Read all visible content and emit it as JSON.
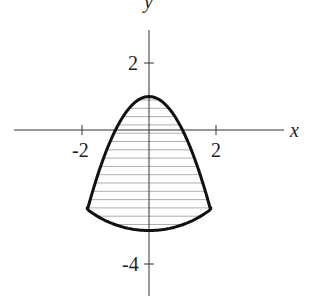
{
  "chart_data": {
    "type": "area",
    "title": "",
    "xlabel": "x",
    "ylabel": "y",
    "x_ticks": [
      -2,
      2
    ],
    "y_ticks": [
      2,
      -4
    ],
    "x_tick_labels": [
      "-2",
      "2"
    ],
    "y_tick_labels": [
      "2",
      "-4"
    ],
    "xlim": [
      -4,
      4
    ],
    "ylim": [
      -5,
      3.5
    ],
    "grid": false,
    "curves": [
      {
        "name": "upper boundary",
        "equation": "y = 1 - x^2"
      },
      {
        "name": "lower boundary",
        "equation": "x^2 + y^2 = 9 (lower arc)"
      }
    ],
    "region": {
      "description": "Shaded region between parabola y = 1 - x^2 and circle x^2 + y^2 = 9",
      "intersections": [
        [
          -1.84,
          -2.37
        ],
        [
          1.84,
          -2.37
        ]
      ],
      "top": [
        0,
        1
      ],
      "bottom": [
        0,
        -3
      ],
      "fill": "horizontal hatching"
    }
  },
  "labels": {
    "x_axis": "x",
    "y_axis": "y",
    "tick_neg2": "-2",
    "tick_pos2": "2",
    "tick_y2": "2",
    "tick_yneg4": "-4"
  }
}
